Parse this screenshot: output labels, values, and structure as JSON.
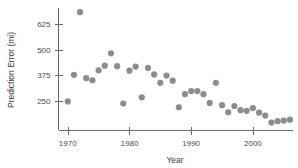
{
  "chart_data": {
    "type": "scatter",
    "title": "",
    "xlabel": "Year",
    "ylabel": "Prediction Error (mi)",
    "xlim": [
      1968.5,
      2006.5
    ],
    "ylim": [
      110,
      700
    ],
    "xticks": [
      1970,
      1980,
      1990,
      2000
    ],
    "yticks": [
      250,
      375,
      500,
      625
    ],
    "grid": false,
    "legend": null,
    "marker": {
      "shape": "circle",
      "color": "#8c8c8c",
      "size": 3.1
    },
    "series": [
      {
        "name": "Prediction Error",
        "points": [
          {
            "x": 1970,
            "y": 250
          },
          {
            "x": 1971,
            "y": 378
          },
          {
            "x": 1972,
            "y": 680
          },
          {
            "x": 1973,
            "y": 362
          },
          {
            "x": 1974,
            "y": 352
          },
          {
            "x": 1975,
            "y": 400
          },
          {
            "x": 1976,
            "y": 422
          },
          {
            "x": 1977,
            "y": 482
          },
          {
            "x": 1978,
            "y": 420
          },
          {
            "x": 1979,
            "y": 240
          },
          {
            "x": 1980,
            "y": 398
          },
          {
            "x": 1981,
            "y": 418
          },
          {
            "x": 1982,
            "y": 270
          },
          {
            "x": 1983,
            "y": 412
          },
          {
            "x": 1984,
            "y": 380
          },
          {
            "x": 1985,
            "y": 340
          },
          {
            "x": 1986,
            "y": 375
          },
          {
            "x": 1987,
            "y": 350
          },
          {
            "x": 1988,
            "y": 222
          },
          {
            "x": 1989,
            "y": 285
          },
          {
            "x": 1990,
            "y": 300
          },
          {
            "x": 1991,
            "y": 300
          },
          {
            "x": 1992,
            "y": 285
          },
          {
            "x": 1993,
            "y": 243
          },
          {
            "x": 1994,
            "y": 340
          },
          {
            "x": 1995,
            "y": 232
          },
          {
            "x": 1996,
            "y": 198
          },
          {
            "x": 1997,
            "y": 228
          },
          {
            "x": 1998,
            "y": 208
          },
          {
            "x": 1999,
            "y": 205
          },
          {
            "x": 2000,
            "y": 218
          },
          {
            "x": 2001,
            "y": 196
          },
          {
            "x": 2002,
            "y": 182
          },
          {
            "x": 2003,
            "y": 148
          },
          {
            "x": 2004,
            "y": 155
          },
          {
            "x": 2005,
            "y": 158
          },
          {
            "x": 2006,
            "y": 162
          }
        ]
      }
    ]
  },
  "axes": {
    "y_label": "Prediction Error (mi)",
    "x_label": "Year",
    "y_tick_labels": [
      "625",
      "500",
      "375",
      "250"
    ],
    "x_tick_labels": [
      "1970",
      "1980",
      "1990",
      "2000"
    ]
  }
}
